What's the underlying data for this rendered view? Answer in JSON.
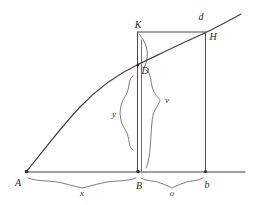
{
  "figure": {
    "kind": "geometric-diagram",
    "background_color": "#ffffff",
    "ink_color": "#3f3f3f"
  },
  "labels": {
    "point_a": "A",
    "point_b_lower": "B",
    "point_b_right": "b",
    "point_k": "K",
    "point_h": "H",
    "point_d_upper": "d",
    "point_d_inner": "D",
    "segment_x": "x",
    "segment_o": "o",
    "ordinate_y": "y",
    "ordinate_v": "v"
  },
  "geometry": {
    "baseline": {
      "x1": 26,
      "y1": 172,
      "x2": 245,
      "y2": 172
    },
    "points": {
      "A": {
        "x": 26,
        "y": 172
      },
      "B": {
        "x": 138,
        "y": 172
      },
      "b": {
        "x": 205,
        "y": 172
      },
      "K": {
        "x": 138,
        "y": 32
      },
      "H": {
        "x": 205,
        "y": 32
      },
      "D": {
        "x": 138,
        "y": 65
      }
    },
    "curve_start": {
      "x": 26,
      "y": 172
    },
    "curve_end": {
      "x": 241,
      "y": 14
    },
    "rectangle": {
      "left": 138,
      "top": 32,
      "right": 205,
      "bottom": 172
    }
  }
}
